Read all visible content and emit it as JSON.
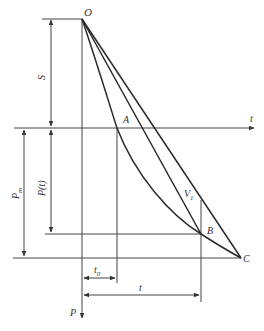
{
  "diagram": {
    "labels": {
      "origin": "O",
      "point_a": "A",
      "point_b": "B",
      "point_c": "C",
      "velocity": "V",
      "velocity_sub": "1",
      "time_axis": "t",
      "p_axis": "P",
      "s_dim": "S",
      "pt_dim": "P(t)",
      "pm_dim": "P",
      "pm_sub": "m",
      "t0_dim": "t",
      "t0_sub": "0",
      "t_dim": "t"
    },
    "colors": {
      "line": "#2a2a2a",
      "thin": "#555555",
      "text": "#333333"
    }
  }
}
